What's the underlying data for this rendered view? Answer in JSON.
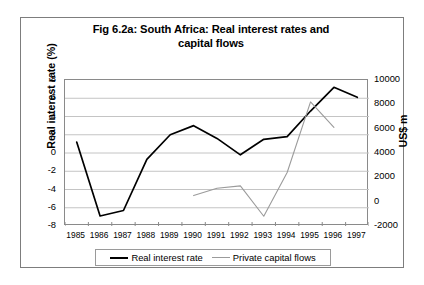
{
  "chart_data": {
    "type": "line",
    "title": "Fig 6.2a: South Africa: Real interest rates and capital flows",
    "title_line1": "Fig 6.2a: South Africa: Real interest rates and",
    "title_line2": "capital flows",
    "xlabel": "",
    "ylabel": "Real interest rate (%)",
    "y2label": "US$ m",
    "grid": true,
    "legend_position": "bottom",
    "x": [
      1985,
      1986,
      1987,
      1988,
      1989,
      1990,
      1991,
      1992,
      1993,
      1994,
      1995,
      1996,
      1997
    ],
    "categories": [
      "1985",
      "1986",
      "1987",
      "1988",
      "1989",
      "1990",
      "1991",
      "1992",
      "1993",
      "1994",
      "1995",
      "1996",
      "1997"
    ],
    "ylim": [
      -8,
      8
    ],
    "yticks": [
      8,
      6,
      4,
      2,
      0,
      -2,
      -4,
      -6,
      -8
    ],
    "ytick_labels": [
      "8",
      "6",
      "4",
      "2",
      "0",
      "-2",
      "-4",
      "-6",
      "-8"
    ],
    "y2lim": [
      -2000,
      10000
    ],
    "y2ticks": [
      10000,
      8000,
      6000,
      4000,
      2000,
      0,
      -2000
    ],
    "y2tick_labels": [
      "10000",
      "8000",
      "6000",
      "4000",
      "2000",
      "0",
      "-2000"
    ],
    "series": [
      {
        "name": "Real interest rate",
        "axis": "left",
        "color": "#000000",
        "units": "%",
        "values": [
          1.2,
          -6.9,
          -6.3,
          -0.7,
          2.0,
          3.0,
          1.6,
          -0.2,
          1.5,
          1.8,
          4.6,
          7.2,
          6.1
        ]
      },
      {
        "name": "Private capital flows",
        "axis": "right",
        "color": "#9b9b9b",
        "units": "US$ m",
        "values": [
          null,
          null,
          null,
          null,
          null,
          500,
          1100,
          1300,
          -1200,
          2400,
          8200,
          6100,
          null
        ]
      }
    ]
  },
  "legend": {
    "items": [
      {
        "label": "Real interest rate"
      },
      {
        "label": "Private capital flows"
      }
    ]
  },
  "colors": {
    "series_real_interest_rate": "#000000",
    "series_private_capital_flows": "#9b9b9b",
    "grid": "#c4c4c4",
    "axis": "#8a8a8a",
    "frame": "#7d7d7d",
    "background": "#ffffff"
  }
}
